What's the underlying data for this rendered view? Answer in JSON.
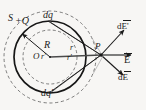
{
  "figure": {
    "background_color": "#f7f6f4",
    "ink_color": "#1a1a1a"
  },
  "labels": {
    "gaussian_surface": "S",
    "total_charge": "+Q",
    "charge_element_upper": "dq",
    "charge_element_lower": "dq'",
    "sphere_radius": "R",
    "center": "O",
    "center_radius_prime": "r'",
    "distance_r": "r",
    "distance_r_prime": "r'",
    "field_point": "P",
    "field_upper": "dE'",
    "field_resultant": "E",
    "field_lower": "dE"
  },
  "geometry": {
    "center": {
      "x": 50,
      "y": 57
    },
    "field_point": {
      "x": 101,
      "y": 55
    },
    "solid_sphere_radius": 36,
    "inner_dashed_radius": 27,
    "outer_dashed_radius": 46,
    "radius_arrow_angle_deg": 140
  },
  "colors": {
    "ink": "#1a1a1a",
    "paper": "#f7f6f4",
    "dashed": "#595959"
  }
}
